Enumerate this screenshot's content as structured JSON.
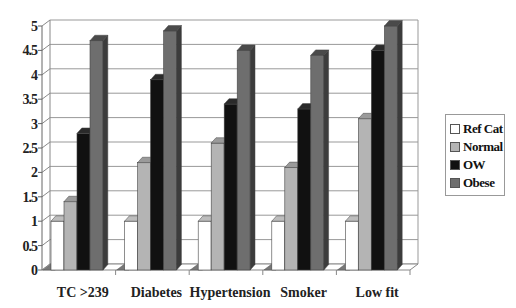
{
  "chart_data": {
    "type": "bar",
    "subtype": "3d-clustered-column",
    "title": "",
    "xlabel": "",
    "ylabel": "",
    "ylim": [
      0,
      5
    ],
    "yticks": [
      "0",
      "0.5",
      "1",
      "1.5",
      "2",
      "2.5",
      "3",
      "3.5",
      "4",
      "4.5",
      "5"
    ],
    "grid": true,
    "legend_position": "right",
    "categories": [
      "TC >239",
      "Diabetes",
      "Hypertension",
      "Smoker",
      "Low fit"
    ],
    "series": [
      {
        "name": "Ref Cat",
        "color": "#ffffff",
        "values": [
          1,
          1,
          1,
          1,
          1
        ]
      },
      {
        "name": "Normal",
        "color": "#b4b4b4",
        "values": [
          1.4,
          2.2,
          2.6,
          2.1,
          3.1
        ]
      },
      {
        "name": "OW",
        "color": "#111111",
        "values": [
          2.8,
          3.9,
          3.4,
          3.3,
          4.5
        ]
      },
      {
        "name": "Obese",
        "color": "#6e6e6e",
        "values": [
          4.7,
          4.9,
          4.5,
          4.4,
          5.0
        ]
      }
    ]
  },
  "legend": {
    "items": [
      {
        "label": "Ref Cat",
        "color": "#ffffff"
      },
      {
        "label": "Normal",
        "color": "#b4b4b4"
      },
      {
        "label": "OW",
        "color": "#111111"
      },
      {
        "label": "Obese",
        "color": "#6e6e6e"
      }
    ]
  }
}
